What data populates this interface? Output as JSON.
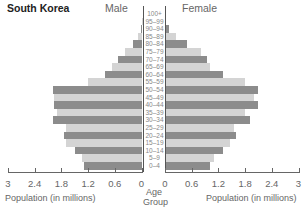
{
  "chart_data": {
    "type": "bar",
    "subtype": "population-pyramid",
    "title": "South Korea",
    "left_series_label": "Male",
    "right_series_label": "Female",
    "xlabel": "Population (in millions)",
    "center_label": "Age Group",
    "xlim": [
      0,
      3
    ],
    "x_ticks_left": [
      "3",
      "2.4",
      "1.8",
      "1.2",
      "0.6",
      "0"
    ],
    "x_ticks_right": [
      "0",
      "0.6",
      "1.2",
      "1.8",
      "2.4",
      "3"
    ],
    "categories": [
      "100+",
      "95-99",
      "90-94",
      "85-89",
      "80-84",
      "75-79",
      "70-74",
      "65-69",
      "60-64",
      "55-59",
      "50-54",
      "45-49",
      "40-44",
      "35-39",
      "30-34",
      "25-29",
      "20-24",
      "15-19",
      "10-14",
      "5-9",
      "0-4"
    ],
    "series": [
      {
        "name": "Male",
        "values": [
          0.0,
          0.01,
          0.03,
          0.1,
          0.2,
          0.38,
          0.55,
          0.68,
          0.83,
          1.22,
          2.0,
          1.98,
          1.98,
          1.9,
          2.0,
          1.7,
          1.75,
          1.7,
          1.5,
          1.35,
          1.3
        ]
      },
      {
        "name": "Female",
        "values": [
          0.0,
          0.02,
          0.1,
          0.25,
          0.5,
          0.8,
          0.95,
          1.0,
          1.3,
          1.8,
          2.1,
          2.0,
          2.1,
          1.8,
          1.9,
          1.55,
          1.6,
          1.45,
          1.3,
          1.1,
          1.0
        ]
      }
    ],
    "colors": {
      "dark": "#8c8c8c",
      "light": "#d4d4d4"
    },
    "grid": false,
    "legend": "none"
  },
  "labels": {
    "title": "South Korea",
    "male": "Male",
    "female": "Female",
    "x_axis_left": "Population (in millions)",
    "x_axis_right": "Population (in millions)",
    "age_group_line1": "Age",
    "age_group_line2": "Group"
  }
}
